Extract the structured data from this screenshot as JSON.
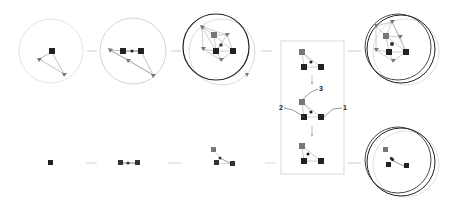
{
  "figure": {
    "colors": {
      "node_dark": "#222222",
      "node_gray": "#777777",
      "edge": "#9a9a9a",
      "circle_light": "#d0d0d0",
      "circle_dark": "#222222",
      "connector": "#bbbbbb",
      "panel_border": "#cccccc"
    },
    "panel": {
      "labels": {
        "one": "1",
        "two": "2",
        "three": "3"
      }
    },
    "top_row": [
      {
        "stage": 1,
        "circles": 1
      },
      {
        "stage": 2,
        "circles": 1
      },
      {
        "stage": 3,
        "circles": 2
      },
      {
        "stage": 4,
        "circles": 3
      }
    ],
    "bottom_row": [
      {
        "stage": 1,
        "circles": 0
      },
      {
        "stage": 2,
        "circles": 0
      },
      {
        "stage": 3,
        "circles": 0
      },
      {
        "stage": 4,
        "circles": 3
      }
    ]
  }
}
